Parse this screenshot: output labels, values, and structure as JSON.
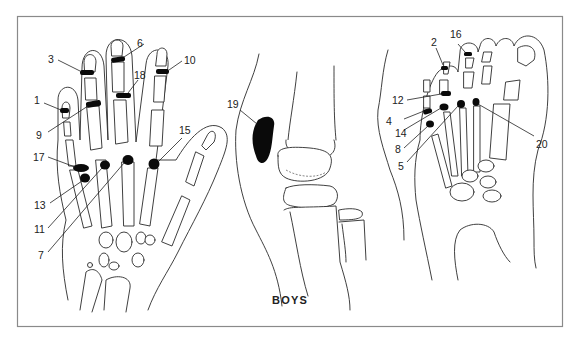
{
  "caption": "BOYS",
  "colors": {
    "frame": "#8a8a8a",
    "line": "#2a2a2a",
    "site": "#0a0a0a",
    "background": "#ffffff"
  },
  "panels": [
    {
      "name": "hand",
      "labels": [
        "3",
        "6",
        "10",
        "18",
        "1",
        "9",
        "15",
        "17",
        "13",
        "11",
        "7"
      ]
    },
    {
      "name": "knee",
      "labels": [
        "19"
      ]
    },
    {
      "name": "foot",
      "labels": [
        "2",
        "16",
        "12",
        "4",
        "14",
        "8",
        "5",
        "20"
      ]
    }
  ],
  "labels": {
    "l1": "1",
    "l2": "2",
    "l3": "3",
    "l4": "4",
    "l5": "5",
    "l6": "6",
    "l7": "7",
    "l8": "8",
    "l9": "9",
    "l10": "10",
    "l11": "11",
    "l12": "12",
    "l13": "13",
    "l14": "14",
    "l15": "15",
    "l16": "16",
    "l17": "17",
    "l18": "18",
    "l19": "19",
    "l20": "20"
  }
}
